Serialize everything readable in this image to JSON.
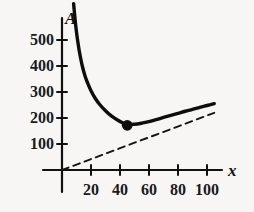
{
  "chart_data": {
    "type": "line",
    "title": "",
    "subtitle": "",
    "xlabel": "x",
    "ylabel": "A",
    "xlim": [
      0,
      112
    ],
    "ylim": [
      0,
      620
    ],
    "grid": false,
    "legend": "none",
    "x_ticks": [
      20,
      40,
      60,
      80,
      100
    ],
    "x_tick_labels": [
      "20",
      "40",
      "60",
      "80",
      "100"
    ],
    "y_ticks": [
      100,
      200,
      300,
      400,
      500
    ],
    "y_tick_labels": [
      "100",
      "200",
      "300",
      "400",
      "500"
    ],
    "series": [
      {
        "name": "A(x)",
        "style": "solid",
        "x": [
          8,
          9,
          10,
          11,
          12,
          14,
          16,
          18,
          20,
          23,
          26,
          30,
          34,
          38,
          42,
          45,
          50,
          55,
          60,
          65,
          70,
          75,
          80,
          85,
          90,
          95,
          100,
          105
        ],
        "values": [
          640,
          580,
          530,
          490,
          455,
          400,
          360,
          330,
          305,
          275,
          252,
          228,
          208,
          193,
          181,
          176,
          176,
          180,
          186,
          194,
          202,
          210,
          218,
          226,
          233,
          241,
          248,
          255
        ]
      },
      {
        "name": "asymptote",
        "style": "dashed",
        "x": [
          0,
          105
        ],
        "values": [
          0,
          220
        ]
      }
    ],
    "annotations": [
      {
        "name": "minimum-point",
        "marker": "filled-circle",
        "x": 45,
        "y": 172
      }
    ]
  },
  "axis": {
    "y_name": "A",
    "x_name": "x"
  },
  "colors": {
    "ink": "#111111",
    "background": "#f7f6f4"
  }
}
